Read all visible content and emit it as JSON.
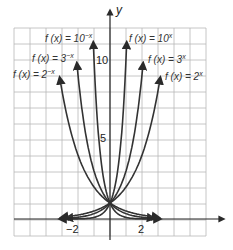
{
  "chart_data": {
    "type": "line",
    "title": "",
    "xlabel": "x",
    "ylabel": "y",
    "xlim": [
      -6,
      6
    ],
    "ylim": [
      -1.5,
      12
    ],
    "grid": true,
    "x_ticks_labeled": [
      {
        "value": -2,
        "label": "−2"
      },
      {
        "value": 2,
        "label": "2"
      }
    ],
    "y_ticks_labeled": [
      {
        "value": 5,
        "label": "5"
      },
      {
        "value": 10,
        "label": "10"
      }
    ],
    "series": [
      {
        "name": "f(x) = 10^-x",
        "base": 10,
        "sign": -1,
        "label_main": "f (x) = 10",
        "label_exp": "−x"
      },
      {
        "name": "f(x) = 3^-x",
        "base": 3,
        "sign": -1,
        "label_main": "f (x) = 3",
        "label_exp": "−x"
      },
      {
        "name": "f(x) = 2^-x",
        "base": 2,
        "sign": -1,
        "label_main": "f (x) = 2",
        "label_exp": "−x"
      },
      {
        "name": "f(x) = 10^x",
        "base": 10,
        "sign": 1,
        "label_main": "f (x) = 10",
        "label_exp": "x"
      },
      {
        "name": "f(x) = 3^x",
        "base": 3,
        "sign": 1,
        "label_main": "f (x) = 3",
        "label_exp": "x"
      },
      {
        "name": "f(x) = 2^x",
        "base": 2,
        "sign": 1,
        "label_main": "f (x) = 2",
        "label_exp": "x"
      }
    ],
    "annotations": [
      "All curves pass through (0, 1)"
    ]
  },
  "labels": {
    "y_axis": "y",
    "tick_neg2": "−2",
    "tick_2": "2",
    "tick_5": "5",
    "tick_10": "10"
  }
}
